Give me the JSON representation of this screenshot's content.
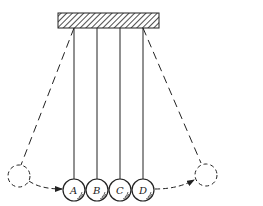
{
  "diagram": {
    "support": {
      "label": "fixed support (hatched)"
    },
    "balls": [
      {
        "label": "A",
        "x": 74
      },
      {
        "label": "B",
        "x": 97
      },
      {
        "label": "C",
        "x": 120
      },
      {
        "label": "D",
        "x": 143
      }
    ],
    "released_position": {
      "side": "left",
      "style": "dashed"
    },
    "final_position": {
      "side": "right",
      "style": "dashed"
    },
    "colors": {
      "line": "#222222",
      "background": "#ffffff"
    }
  }
}
